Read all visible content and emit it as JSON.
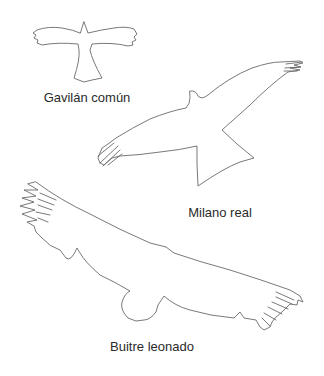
{
  "figure": {
    "birds": [
      {
        "id": "gavilan",
        "label": "Gavilán común",
        "label_pos": {
          "x": 87,
          "y": 90
        }
      },
      {
        "id": "milano",
        "label": "Milano real",
        "label_pos": {
          "x": 220,
          "y": 205
        }
      },
      {
        "id": "buitre",
        "label": "Buitre leonado",
        "label_pos": {
          "x": 152,
          "y": 339
        }
      }
    ],
    "outline_color": "#555555",
    "background": "#ffffff"
  }
}
